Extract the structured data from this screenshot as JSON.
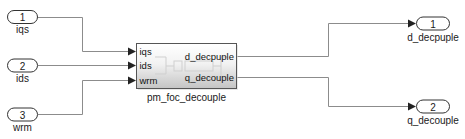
{
  "diagram": {
    "type": "simulink-subsystem",
    "inports": [
      {
        "number": "1",
        "name": "iqs"
      },
      {
        "number": "2",
        "name": "ids"
      },
      {
        "number": "3",
        "name": "wrm"
      }
    ],
    "block": {
      "name": "pm_foc_decouple",
      "input_ports": [
        "iqs",
        "ids",
        "wrm"
      ],
      "output_ports": [
        "d_decpuple",
        "q_decouple"
      ]
    },
    "outports": [
      {
        "number": "1",
        "name": "d_decpuple"
      },
      {
        "number": "2",
        "name": "q_decouple"
      }
    ],
    "connections": [
      {
        "from": "inport-1",
        "to": "pm_foc_decouple.iqs"
      },
      {
        "from": "inport-2",
        "to": "pm_foc_decouple.ids"
      },
      {
        "from": "inport-3",
        "to": "pm_foc_decouple.wrm"
      },
      {
        "from": "pm_foc_decouple.d_decpuple",
        "to": "outport-1"
      },
      {
        "from": "pm_foc_decouple.q_decouple",
        "to": "outport-2"
      }
    ],
    "colors": {
      "signal_line": "#8c8c8c",
      "block_border": "#555555",
      "block_gradient_top": "#ffffff",
      "block_gradient_bottom": "#c4c4c4"
    }
  }
}
